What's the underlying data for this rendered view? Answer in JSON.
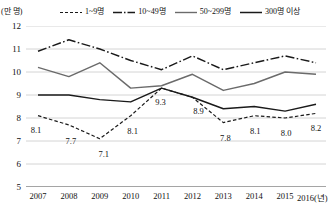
{
  "chart_data": {
    "type": "line",
    "title": "",
    "xlabel": "(년)",
    "ylabel": "(만 명)",
    "y_unit_label": "(만 명)",
    "x_axis_suffix": "(년)",
    "categories": [
      "2007",
      "2008",
      "2009",
      "2010",
      "2011",
      "2012",
      "2013",
      "2014",
      "2015",
      "2016"
    ],
    "ylim": [
      5,
      12
    ],
    "yticks": [
      5,
      6,
      7,
      8,
      9,
      10,
      11,
      12
    ],
    "ytick_labels": [
      "5",
      "6",
      "7",
      "8",
      "9",
      "10",
      "11",
      "12"
    ],
    "grid": true,
    "legend_position": "top",
    "series": [
      {
        "name": "1~9명",
        "style": "dashed",
        "color": "#1a1a1a",
        "values": [
          8.1,
          7.7,
          7.1,
          8.1,
          9.3,
          8.9,
          7.8,
          8.1,
          8.0,
          8.2
        ],
        "point_labels": [
          "8.1",
          "7.7",
          "7.1",
          "8.1",
          "9.3",
          "8.9",
          "7.8",
          "8.1",
          "8.0",
          "8.2"
        ]
      },
      {
        "name": "10~49명",
        "style": "dash-dot",
        "color": "#1a1a1a",
        "values": [
          10.9,
          11.4,
          11.0,
          10.5,
          10.1,
          10.7,
          10.1,
          10.4,
          10.7,
          10.4
        ]
      },
      {
        "name": "50~299명",
        "style": "solid",
        "color": "#6b6b6b",
        "values": [
          10.2,
          9.8,
          10.4,
          9.3,
          9.4,
          9.9,
          9.2,
          9.5,
          10.0,
          9.9
        ]
      },
      {
        "name": "300명 이상",
        "style": "solid",
        "color": "#1a1a1a",
        "values": [
          9.0,
          9.0,
          8.8,
          8.7,
          9.3,
          8.9,
          8.4,
          8.5,
          8.3,
          8.6
        ]
      }
    ]
  },
  "legend": {
    "items": [
      {
        "label": "1~9명",
        "style": "dashed"
      },
      {
        "label": "10~49명",
        "style": "dash-dot"
      },
      {
        "label": "50~299명",
        "style": "solid-gray"
      },
      {
        "label": "300명 이상",
        "style": "solid-black"
      }
    ]
  }
}
